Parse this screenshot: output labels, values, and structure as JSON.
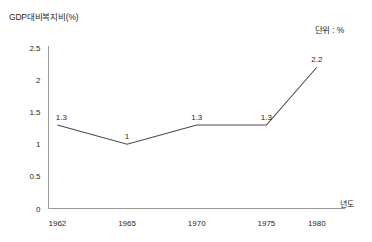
{
  "chart_data": {
    "type": "line",
    "title": "GDP대비복지비(%)",
    "unit_note": "단위 : %",
    "xlabel": "년도",
    "ylabel": "",
    "categories": [
      "1962",
      "1965",
      "1970",
      "1975",
      "1980"
    ],
    "values": [
      1.3,
      1,
      1.3,
      1.3,
      2.2
    ],
    "point_labels": [
      "1.3",
      "1",
      "1.3",
      "1.3",
      "2.2"
    ],
    "yticks": [
      "0",
      "0.5",
      "1",
      "1.5",
      "2",
      "2.5"
    ],
    "ylim": [
      0,
      2.5
    ],
    "grid": false,
    "legend": false,
    "series": [
      {
        "name": "GDP대비복지비",
        "values": [
          1.3,
          1,
          1.3,
          1.3,
          2.2
        ]
      }
    ],
    "colors": {
      "line": "#4a4a4a",
      "axis": "#9a9a9a",
      "text": "#1f1f1f",
      "background": "#ffffff"
    }
  }
}
